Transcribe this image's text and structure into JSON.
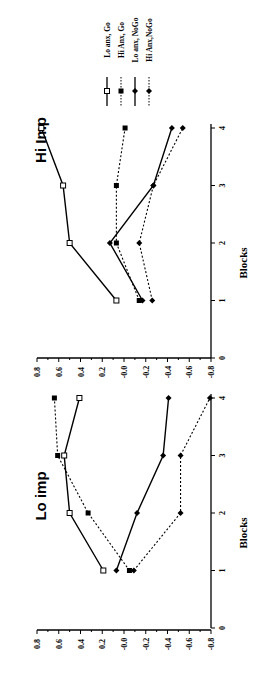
{
  "chart_data": [
    {
      "type": "line",
      "title": "Lo imp",
      "xlabel": "Blocks",
      "ylabel": "",
      "x": [
        1,
        2,
        3,
        4
      ],
      "xlim": [
        0,
        4
      ],
      "xticks": [
        "0",
        "1",
        "2",
        "3",
        "4"
      ],
      "ylim": [
        -0.8,
        0.8
      ],
      "yticks": [
        "0.8",
        "0.6",
        "0.4",
        "0.2",
        "-0.0",
        "-0.2",
        "-0.4",
        "-0.6",
        "-0.8"
      ],
      "grid": false,
      "series": [
        {
          "name": "Lo anx, Go",
          "values": [
            0.19,
            0.5,
            0.55,
            0.41
          ]
        },
        {
          "name": "Hi Anx, Go",
          "values": [
            -0.05,
            0.33,
            0.61,
            0.64
          ]
        },
        {
          "name": "Lo anx, NoGo",
          "values": [
            0.07,
            -0.12,
            -0.36,
            -0.41
          ]
        },
        {
          "name": "Hi Anx,NoGo",
          "values": [
            -0.09,
            -0.52,
            -0.52,
            -0.79
          ]
        }
      ]
    },
    {
      "type": "line",
      "title": "Hi Imp",
      "xlabel": "Blocks",
      "ylabel": "",
      "x": [
        1,
        2,
        3,
        4
      ],
      "xlim": [
        0,
        4
      ],
      "xticks": [
        "0",
        "1",
        "2",
        "3",
        "4"
      ],
      "ylim": [
        -0.8,
        0.8
      ],
      "yticks": [
        "0.8",
        "0.6",
        "0.4",
        "0.2",
        "-0.0",
        "-0.2",
        "-0.4",
        "-0.6",
        "-0.8"
      ],
      "grid": false,
      "legend_position": "right",
      "series": [
        {
          "name": "Lo anx, Go",
          "values": [
            0.07,
            0.5,
            0.56,
            0.76
          ]
        },
        {
          "name": "Hi Anx, Go",
          "values": [
            -0.14,
            0.07,
            0.07,
            -0.01
          ]
        },
        {
          "name": "Lo anx, NoGo",
          "values": [
            -0.17,
            0.13,
            -0.27,
            -0.44
          ]
        },
        {
          "name": "Hi Anx,NoGo",
          "values": [
            -0.26,
            -0.14,
            -0.27,
            -0.54
          ]
        }
      ]
    }
  ],
  "legend": {
    "items": [
      {
        "label": "Lo anx, Go",
        "marker": "open-square",
        "line": "solid"
      },
      {
        "label": "Hi Anx, Go",
        "marker": "filled-square",
        "line": "dashed"
      },
      {
        "label": "Lo anx, NoGo",
        "marker": "filled-diamond",
        "line": "solid"
      },
      {
        "label": "Hi Anx,NoGo",
        "marker": "filled-diamond",
        "line": "dashed"
      }
    ]
  },
  "orientation": "rotated-90-ccw"
}
